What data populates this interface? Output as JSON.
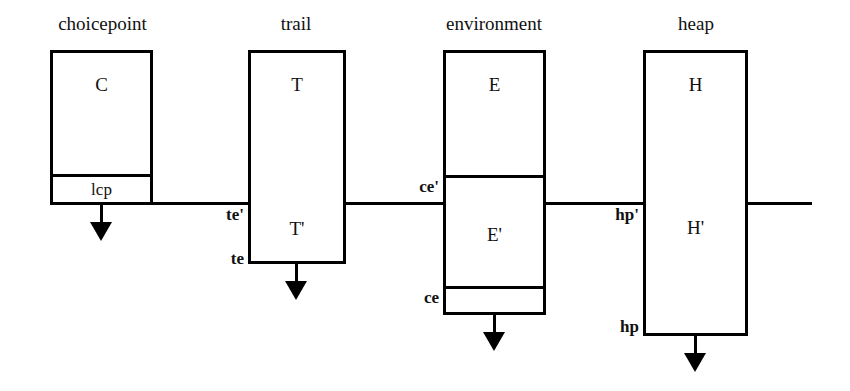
{
  "diagram": {
    "baseline_label": "current-state boundary line",
    "columns": [
      {
        "id": "choicepoint",
        "title": "choicepoint",
        "upper_cell": "C",
        "lower_cell": "lcp",
        "side_labels": [],
        "arrow": "down-arrow",
        "shaded": false
      },
      {
        "id": "trail",
        "title": "trail",
        "upper_cell": "T",
        "lower_cell": "T'",
        "side_labels": [
          "te'",
          "te"
        ],
        "arrow": "down-arrow",
        "shaded": false
      },
      {
        "id": "environment",
        "title": "environment",
        "upper_cell": "E",
        "lower_cell": "E'",
        "side_labels": [
          "ce'",
          "ce"
        ],
        "arrow": "down-arrow",
        "shaded": false
      },
      {
        "id": "heap",
        "title": "heap",
        "upper_cell": "H",
        "lower_cell": "H'",
        "side_labels": [
          "hp'",
          "hp"
        ],
        "arrow": "down-arrow",
        "shaded": true
      }
    ],
    "colors": {
      "ink": "#000000",
      "paper": "#ffffff"
    }
  }
}
